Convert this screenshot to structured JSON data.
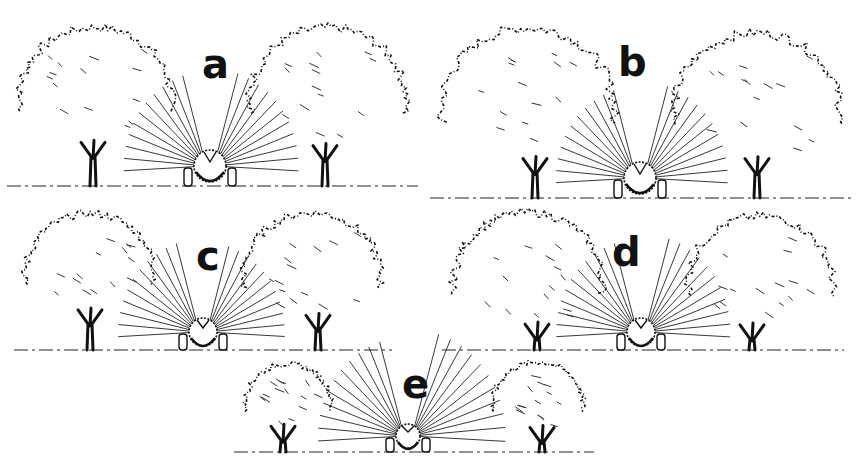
{
  "figure": {
    "panels": [
      {
        "id": "a",
        "label": "a",
        "x": 0,
        "y": 0,
        "w": 430,
        "h": 195,
        "tree_scale": 1.0,
        "spread": 0.88,
        "gap": 0
      },
      {
        "id": "b",
        "label": "b",
        "x": 430,
        "y": 0,
        "w": 431,
        "h": 210,
        "tree_scale": 1.08,
        "spread": 0.92,
        "gap": 0
      },
      {
        "id": "c",
        "label": "c",
        "x": 0,
        "y": 200,
        "w": 420,
        "h": 150,
        "tree_scale": 0.82,
        "spread": 0.9,
        "gap": 0
      },
      {
        "id": "d",
        "label": "d",
        "x": 430,
        "y": 200,
        "w": 431,
        "h": 160,
        "tree_scale": 0.92,
        "spread": 0.94,
        "gap": 0
      },
      {
        "id": "e",
        "label": "e",
        "x": 230,
        "y": 355,
        "w": 400,
        "h": 113,
        "tree_scale": 0.6,
        "spread": 0.6,
        "gap": 0
      }
    ]
  }
}
